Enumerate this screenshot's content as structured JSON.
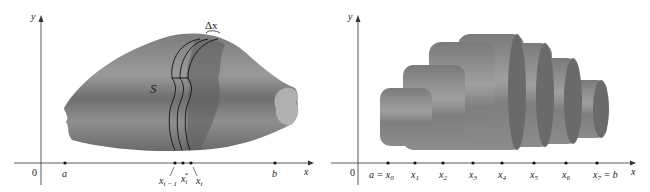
{
  "left_figure": {
    "axis_y_label": "y",
    "axis_x_label": "x",
    "origin_label": "0",
    "solid_label": "S",
    "delta_label": "Δx",
    "ticks": {
      "a": "a",
      "b": "b",
      "xi_minus_1": "x",
      "xi_minus_1_sub": "i − 1",
      "xi_star": "x",
      "xi_star_sub": "i",
      "xi_star_sup": "*",
      "xi": "x",
      "xi_sub": "i"
    }
  },
  "right_figure": {
    "axis_y_label": "y",
    "axis_x_label": "x",
    "origin_label": "0",
    "ticks": [
      {
        "base": "a = x",
        "sub": "0"
      },
      {
        "base": "x",
        "sub": "1"
      },
      {
        "base": "x",
        "sub": "2"
      },
      {
        "base": "x",
        "sub": "3"
      },
      {
        "base": "x",
        "sub": "4"
      },
      {
        "base": "x",
        "sub": "5"
      },
      {
        "base": "x",
        "sub": "6"
      },
      {
        "base": "x",
        "sub": "7",
        "suffix": " = b"
      }
    ]
  },
  "colors": {
    "solid_base": "#8a8a8a",
    "solid_dark": "#6e6e6e",
    "solid_light": "#a8a8a8",
    "axis": "#333333"
  }
}
